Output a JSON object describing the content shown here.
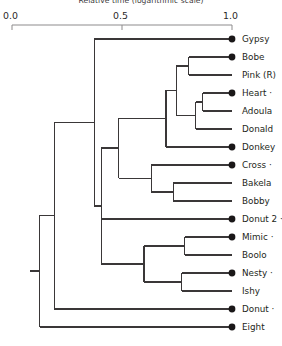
{
  "axis": {
    "title": "Relative time (logarithmic scale)",
    "ticks": [
      {
        "label": "0.0",
        "value": 0.0,
        "x": 12
      },
      {
        "label": "0.5",
        "value": 0.5,
        "x": 122
      },
      {
        "label": "1.0",
        "value": 1.0,
        "x": 232
      }
    ],
    "line_color": "#8d8b8c",
    "range": [
      0.0,
      1.0
    ],
    "pixel_range": [
      12,
      232
    ]
  },
  "chart_data": {
    "type": "dendrogram",
    "title": "Relative time (logarithmic scale)",
    "xlabel": "Relative time (logarithmic scale)",
    "ylabel": "",
    "xlim": [
      0.0,
      1.0
    ],
    "grid": false,
    "legend": "none",
    "line_color": "#3a3738",
    "marker_color": "#1a1718",
    "leaf_count": 17,
    "leaves": [
      {
        "index": 0,
        "name": "Gypsy",
        "label": "Gypsy",
        "y": 39,
        "branch_x": 0.374,
        "marker": true,
        "trailing_dot": false
      },
      {
        "index": 1,
        "name": "Bobe",
        "label": "Bobe",
        "y": 57,
        "branch_x": 0.804,
        "marker": true,
        "trailing_dot": false
      },
      {
        "index": 2,
        "name": "Pink (R)",
        "label": "Pink (R)",
        "y": 75,
        "branch_x": 0.804,
        "marker": false,
        "trailing_dot": false
      },
      {
        "index": 3,
        "name": "Heart",
        "label": "Heart",
        "y": 93,
        "branch_x": 0.868,
        "marker": true,
        "trailing_dot": true
      },
      {
        "index": 4,
        "name": "Adoula",
        "label": "Adoula",
        "y": 111,
        "branch_x": 0.868,
        "marker": false,
        "trailing_dot": false
      },
      {
        "index": 5,
        "name": "Donald",
        "label": "Donald",
        "y": 129,
        "branch_x": 0.836,
        "marker": false,
        "trailing_dot": false
      },
      {
        "index": 6,
        "name": "Donkey",
        "label": "Donkey",
        "y": 147,
        "branch_x": 0.746,
        "marker": true,
        "trailing_dot": false
      },
      {
        "index": 7,
        "name": "Cross",
        "label": "Cross",
        "y": 165,
        "branch_x": 0.632,
        "marker": true,
        "trailing_dot": true
      },
      {
        "index": 8,
        "name": "Bakela",
        "label": "Bakela",
        "y": 183,
        "branch_x": 0.732,
        "marker": false,
        "trailing_dot": false
      },
      {
        "index": 9,
        "name": "Bobby",
        "label": "Bobby",
        "y": 201,
        "branch_x": 0.732,
        "marker": false,
        "trailing_dot": false
      },
      {
        "index": 10,
        "name": "Donut 2",
        "label": "Donut 2",
        "y": 219,
        "branch_x": 0.486,
        "marker": true,
        "trailing_dot": true
      },
      {
        "index": 11,
        "name": "Mimic",
        "label": "Mimic",
        "y": 237,
        "branch_x": 0.786,
        "marker": true,
        "trailing_dot": true
      },
      {
        "index": 12,
        "name": "Boolo",
        "label": "Boolo",
        "y": 255,
        "branch_x": 0.786,
        "marker": false,
        "trailing_dot": false
      },
      {
        "index": 13,
        "name": "Nesty",
        "label": "Nesty",
        "y": 273,
        "branch_x": 0.772,
        "marker": true,
        "trailing_dot": true
      },
      {
        "index": 14,
        "name": "Ishy",
        "label": "Ishy",
        "y": 291,
        "branch_x": 0.772,
        "marker": false,
        "trailing_dot": false
      },
      {
        "index": 15,
        "name": "Donut",
        "label": "Donut",
        "y": 309,
        "branch_x": 0.192,
        "marker": true,
        "trailing_dot": true
      },
      {
        "index": 16,
        "name": "Eight",
        "label": "Eight",
        "y": 327,
        "branch_x": 0.127,
        "marker": true,
        "trailing_dot": false
      }
    ],
    "internal_nodes": [
      {
        "id": "n_bobe_pink",
        "x": 0.804,
        "children_y": [
          57,
          75
        ],
        "label": ""
      },
      {
        "id": "n_heart_adoula",
        "x": 0.868,
        "children_y": [
          93,
          111
        ],
        "label": ""
      },
      {
        "id": "n_ha_donald",
        "x": 0.836,
        "children_y": [
          102,
          129
        ],
        "label": ""
      },
      {
        "id": "n_bp_had",
        "x": 0.746,
        "children_y": [
          66,
          115
        ],
        "label": ""
      },
      {
        "id": "n_upper_donkey",
        "x": 0.7,
        "children_y": [
          90,
          147
        ],
        "label": ""
      },
      {
        "id": "n_bakela_bobby",
        "x": 0.732,
        "children_y": [
          183,
          201
        ],
        "label": ""
      },
      {
        "id": "n_cross_bb",
        "x": 0.632,
        "children_y": [
          165,
          192
        ],
        "label": ""
      },
      {
        "id": "n_mid",
        "x": 0.486,
        "children_y": [
          118,
          178
        ],
        "label": ""
      },
      {
        "id": "n_mimic_boolo",
        "x": 0.786,
        "children_y": [
          237,
          255
        ],
        "label": ""
      },
      {
        "id": "n_nesty_ishy",
        "x": 0.772,
        "children_y": [
          273,
          291
        ],
        "label": ""
      },
      {
        "id": "n_lower_pair",
        "x": 0.6,
        "children_y": [
          246,
          282
        ],
        "label": ""
      },
      {
        "id": "n_mid_donut2",
        "x": 0.405,
        "children_y": [
          148,
          264
        ],
        "label": ""
      },
      {
        "id": "n_top_mid",
        "x": 0.374,
        "children_y": [
          39,
          206
        ],
        "label": ""
      },
      {
        "id": "n_with_donut",
        "x": 0.192,
        "children_y": [
          122,
          309
        ],
        "label": ""
      },
      {
        "id": "n_root",
        "x": 0.127,
        "children_y": [
          215,
          327
        ],
        "label": ""
      }
    ]
  },
  "leaf_geometry": {
    "tip_x": 232,
    "marker_radius": 3.4,
    "label_offset_x": 10,
    "first_leaf_y": 39,
    "leaf_spacing": 18
  }
}
